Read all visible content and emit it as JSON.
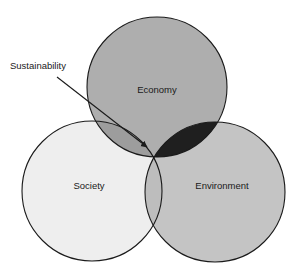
{
  "diagram": {
    "type": "venn-3-set",
    "background_color": "#ffffff",
    "stroke_color": "#1a1a1a",
    "stroke_width": 1.1,
    "sets": [
      {
        "key": "economy",
        "label": "Economy",
        "fill_color": "#a8a8a8",
        "center_x": 157,
        "center_y": 87,
        "radius": 70,
        "label_x": 157,
        "label_y": 90
      },
      {
        "key": "society",
        "label": "Society",
        "fill_color": "#eeeeee",
        "center_x": 92,
        "center_y": 191,
        "radius": 70,
        "label_x": 89,
        "label_y": 186
      },
      {
        "key": "environment",
        "label": "Environment",
        "fill_color": "#c4c4c4",
        "center_x": 215,
        "center_y": 192,
        "radius": 70,
        "label_x": 222,
        "label_y": 186
      }
    ],
    "intersections": [
      {
        "key": "economy-environment",
        "sets": [
          "economy",
          "environment"
        ],
        "fill_color": "#1f1f1f",
        "description": "dark lens where Economy overlaps Environment"
      },
      {
        "key": "economy-society",
        "sets": [
          "economy",
          "society"
        ],
        "fill_color": "#9d9d9d",
        "description": "overlap of Economy and Society"
      },
      {
        "key": "society-environment",
        "sets": [
          "society",
          "environment"
        ],
        "fill_color": "#bdbdbd",
        "description": "overlap of Society and Environment"
      },
      {
        "key": "triple",
        "sets": [
          "economy",
          "society",
          "environment"
        ],
        "fill_color": "#9a9a9a",
        "description": "central triple overlap indicated by the Sustainability arrow"
      }
    ],
    "callout": {
      "label": "Sustainability",
      "label_x": 10,
      "label_y": 66,
      "arrow_color": "#1a1a1a",
      "line_start_x": 57,
      "line_start_y": 77,
      "line_end_x": 150,
      "line_end_y": 150,
      "arrowhead_size": 11,
      "target_region": "triple",
      "target_x": 152,
      "target_y": 152
    }
  }
}
